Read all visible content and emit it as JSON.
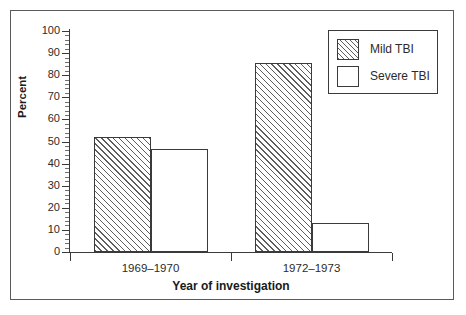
{
  "chart_data": {
    "type": "bar",
    "title": "",
    "xlabel": "Year of investigation",
    "ylabel": "Percent",
    "categories": [
      "1969–1970",
      "1972–1973"
    ],
    "series": [
      {
        "name": "Mild TBI",
        "values": [
          52,
          85.5
        ],
        "fill": "hatched"
      },
      {
        "name": "Severe TBI",
        "values": [
          46.5,
          13
        ],
        "fill": "white"
      }
    ],
    "ylim": [
      0,
      100
    ],
    "ytick_labels": [
      "100",
      "90",
      "80",
      "70",
      "60",
      "50",
      "40",
      "30",
      "20",
      "10",
      "0"
    ],
    "ytick_values": [
      100,
      90,
      80,
      70,
      60,
      50,
      40,
      30,
      20,
      10,
      0
    ],
    "yminor_step": 2,
    "grid": false,
    "legend_position": "top-right",
    "legend_entries": [
      "Mild TBI",
      "Severe TBI"
    ]
  },
  "axes": {
    "y_title": "Percent",
    "x_title": "Year of investigation"
  },
  "legend": {
    "items": [
      {
        "label": "Mild TBI",
        "swatch": "hatched-square-icon"
      },
      {
        "label": "Severe TBI",
        "swatch": "empty-square-icon"
      }
    ]
  },
  "colors": {
    "frame": "#5a5a5a",
    "axis": "#3a3a3a",
    "hatch": "#5d5d5d",
    "text": "#2b2b2b",
    "background": "#ffffff"
  }
}
